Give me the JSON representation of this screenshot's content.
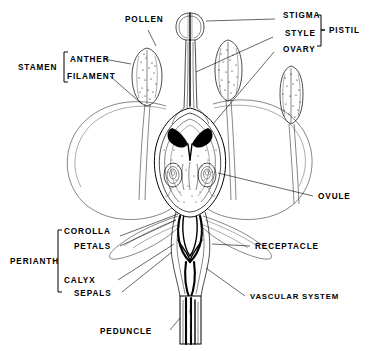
{
  "figure": {
    "background_color": "#ffffff",
    "ink_color": "#000000",
    "width": 371,
    "height": 351
  },
  "labels": {
    "pollen": "POLLEN",
    "stamen": "STAMEN",
    "anther": "ANTHER",
    "filament": "FILAMENT",
    "stigma": "STIGMA",
    "style": "STYLE",
    "ovary": "OVARY",
    "pistil": "PISTIL",
    "ovule": "OVULE",
    "receptacle": "RECEPTACLE",
    "vascular_system": "VASCULAR SYSTEM",
    "perianth": "PERIANTH",
    "corolla": "COROLLA",
    "petals": "PETALS",
    "calyx": "CALYX",
    "sepals": "SEPALS",
    "peduncle": "PEDUNCLE"
  },
  "groups": {
    "stamen_members": [
      "ANTHER",
      "FILAMENT"
    ],
    "pistil_members": [
      "STIGMA",
      "STYLE",
      "OVARY"
    ],
    "perianth_members": [
      "COROLLA",
      "PETALS",
      "CALYX",
      "SEPALS"
    ]
  },
  "parts": {
    "anthers_count": 3,
    "ovules_count": 2,
    "petals_count": 2,
    "sepals_count": 2
  }
}
